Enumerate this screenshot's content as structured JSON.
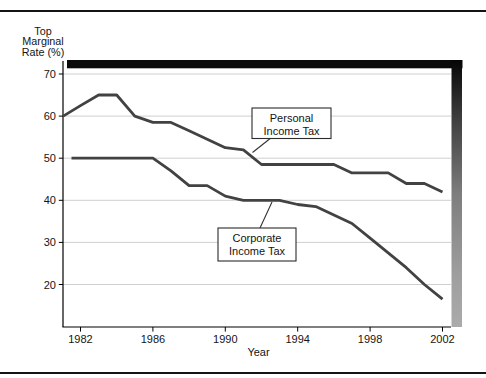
{
  "figure": {
    "y_axis_title_lines": [
      "Top",
      "Marginal",
      "Rate (%)"
    ],
    "x_axis_title": "Year"
  },
  "chart_data": {
    "type": "line",
    "title": "",
    "xlabel": "Year",
    "ylabel": "Top Marginal Rate (%)",
    "x_ticks": [
      1982,
      1986,
      1990,
      1994,
      1998,
      2002
    ],
    "y_ticks": [
      20,
      30,
      40,
      50,
      60,
      70
    ],
    "xlim": [
      1981,
      2002.45
    ],
    "ylim": [
      10,
      71.5
    ],
    "grid": true,
    "gridline_color": "#c9c9c9",
    "line_color": "#424242",
    "shadow_colors": {
      "top_bar": "#0a0a0a",
      "right_bar_top": "#050505",
      "right_bar_bottom": "#ababab"
    },
    "series": [
      {
        "name": "Personal Income Tax",
        "points": [
          [
            1981,
            60
          ],
          [
            1982,
            62.5
          ],
          [
            1983,
            65
          ],
          [
            1984,
            65
          ],
          [
            1985,
            60
          ],
          [
            1986,
            58.5
          ],
          [
            1987,
            58.5
          ],
          [
            1988,
            56.5
          ],
          [
            1989,
            54.5
          ],
          [
            1990,
            52.5
          ],
          [
            1991,
            52
          ],
          [
            1992,
            48.5
          ],
          [
            1993,
            48.5
          ],
          [
            1994,
            48.5
          ],
          [
            1995,
            48.5
          ],
          [
            1996,
            48.5
          ],
          [
            1997,
            46.5
          ],
          [
            1998,
            46.5
          ],
          [
            1999,
            46.5
          ],
          [
            2000,
            44
          ],
          [
            2001,
            44
          ],
          [
            2002,
            42
          ]
        ]
      },
      {
        "name": "Corporate Income Tax",
        "points": [
          [
            1981.5,
            50
          ],
          [
            1982,
            50
          ],
          [
            1983,
            50
          ],
          [
            1984,
            50
          ],
          [
            1985,
            50
          ],
          [
            1986,
            50
          ],
          [
            1987,
            47
          ],
          [
            1988,
            43.5
          ],
          [
            1989,
            43.5
          ],
          [
            1990,
            41
          ],
          [
            1991,
            40
          ],
          [
            1992,
            40
          ],
          [
            1993,
            40
          ],
          [
            1994,
            39
          ],
          [
            1995,
            38.5
          ],
          [
            1996,
            36.5
          ],
          [
            1997,
            34.5
          ],
          [
            1998,
            31
          ],
          [
            1999,
            27.5
          ],
          [
            2000,
            24
          ],
          [
            2001,
            20
          ],
          [
            2002,
            16.5
          ]
        ]
      }
    ],
    "annotations": [
      {
        "lines": [
          "Personal",
          "Income Tax"
        ],
        "target_series": "Personal Income Tax"
      },
      {
        "lines": [
          "Corporate",
          "Income Tax"
        ],
        "target_series": "Corporate Income Tax"
      }
    ]
  }
}
